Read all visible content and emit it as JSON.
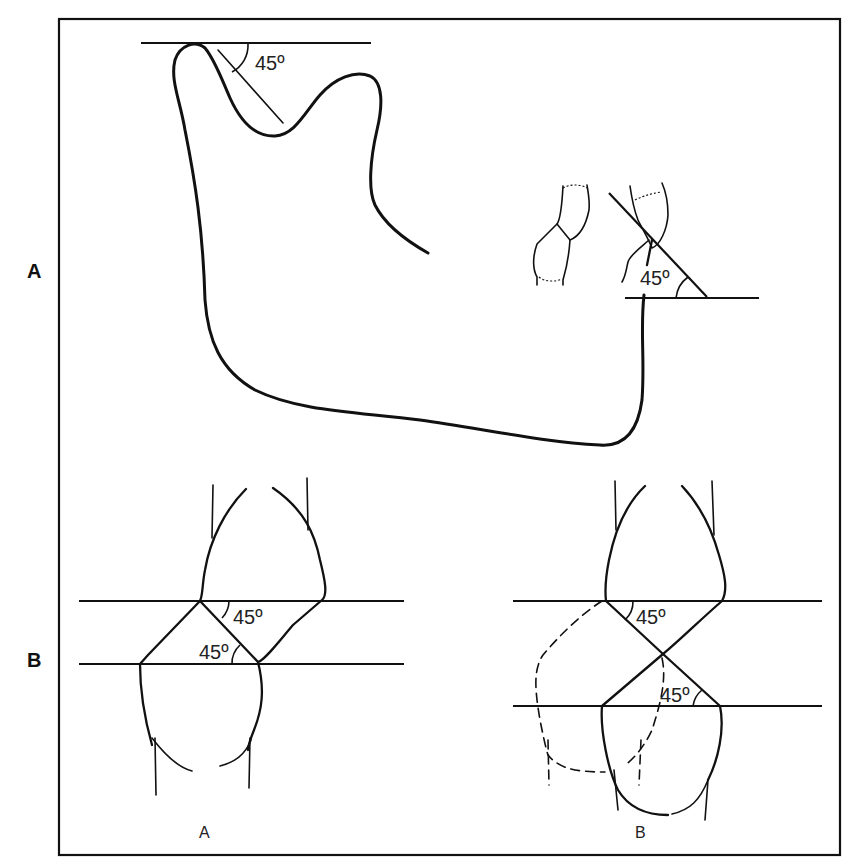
{
  "figure": {
    "panels": [
      {
        "id": "A",
        "label": "A",
        "description": "Mandible profile with condyle guidance at 45° and incisor guidance at 45°"
      },
      {
        "id": "B",
        "label": "B",
        "description": "Incisor overlap diagrams showing 45° guidance"
      }
    ],
    "panel_a": {
      "condyle_angle": "45º",
      "incisor_angle": "45º"
    },
    "panel_b": {
      "left": {
        "caption": "A",
        "upper_angle": "45º",
        "lower_angle": "45º"
      },
      "right": {
        "caption": "B",
        "upper_angle": "45º",
        "lower_angle": "45º"
      }
    },
    "colors": {
      "line": "#111111",
      "background": "#ffffff"
    }
  }
}
